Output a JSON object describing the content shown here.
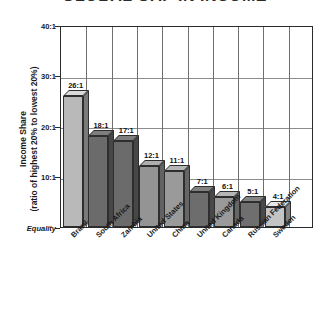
{
  "chart_data": {
    "type": "bar",
    "title": "GLOBAL GAP IN INCOME",
    "xlabel": "",
    "ylabel": "Income Share (ratio of highest 20% to lowest 20%)",
    "ylabel_line1": "Income Share",
    "ylabel_line2": "(ratio of highest 20% to lowest 20%)",
    "categories": [
      "Brazil",
      "South Africa",
      "Zambia",
      "United States",
      "China",
      "United Kingdom",
      "Canada",
      "Russian Federation",
      "Sweden"
    ],
    "values": [
      26,
      18,
      17,
      12,
      11,
      7,
      6,
      5,
      4
    ],
    "value_labels": [
      "26:1",
      "18:1",
      "17:1",
      "12:1",
      "11:1",
      "7:1",
      "6:1",
      "5:1",
      "4:1"
    ],
    "bar_colors": [
      "#b9b9b9",
      "#6b6b6b",
      "#6b6b6b",
      "#949494",
      "#9a9a9a",
      "#6d6d6d",
      "#9a9a9a",
      "#6f6f6f",
      "#c4c4c4"
    ],
    "ylim": [
      0,
      40
    ],
    "yticks": [
      0,
      10,
      20,
      30,
      40
    ],
    "ytick_labels": [
      "Equality",
      "10:1",
      "20:1",
      "30:1",
      "40:1"
    ],
    "grid": true,
    "legend": "none",
    "axis_color": "#2b2b2b",
    "grid_color": "#8c8c8c",
    "background": "#ffffff"
  }
}
